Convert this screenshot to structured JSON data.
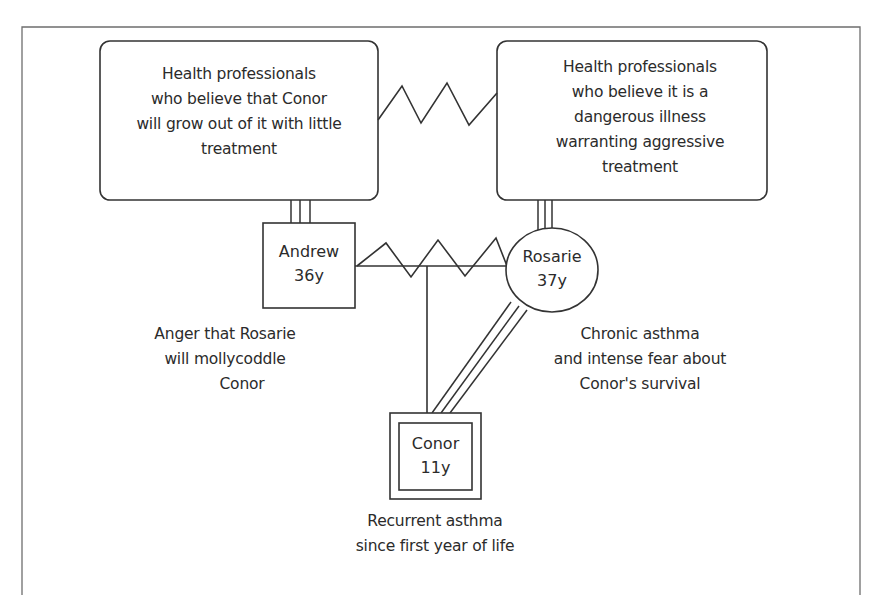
{
  "diagram": {
    "type": "genogram",
    "colors": {
      "line": "#333333",
      "frame": "#6e6e6e",
      "background": "#ffffff",
      "text": "#2b2b2b"
    },
    "professionals_left": {
      "lines": [
        "Health professionals",
        "who believe that Conor",
        "will grow out of it with little",
        "treatment"
      ]
    },
    "professionals_right": {
      "lines": [
        "Health professionals",
        "who believe it is a",
        "dangerous illness",
        "warranting aggressive",
        "treatment"
      ]
    },
    "andrew": {
      "name": "Andrew",
      "age": "36y",
      "shape": "square",
      "annotation": [
        "Anger that Rosarie",
        "will mollycoddle",
        "Conor"
      ]
    },
    "rosarie": {
      "name": "Rosarie",
      "age": "37y",
      "shape": "circle",
      "annotation": [
        "Chronic asthma",
        "and intense fear about",
        "Conor's survival"
      ]
    },
    "conor": {
      "name": "Conor",
      "age": "11y",
      "shape": "double-square (index patient)",
      "annotation": [
        "Recurrent asthma",
        "since first year of life"
      ]
    },
    "relationships": [
      {
        "from": "professionals_left",
        "to": "professionals_right",
        "type": "conflict (zigzag)"
      },
      {
        "from": "professionals_left",
        "to": "andrew",
        "type": "very close (triple line)"
      },
      {
        "from": "professionals_right",
        "to": "rosarie",
        "type": "very close (triple line)"
      },
      {
        "from": "andrew",
        "to": "rosarie",
        "type": "marriage with conflict (zigzag)"
      },
      {
        "from": "rosarie",
        "to": "conor",
        "type": "very close (triple line)"
      },
      {
        "from": "marriage",
        "to": "conor",
        "type": "child line"
      }
    ]
  }
}
